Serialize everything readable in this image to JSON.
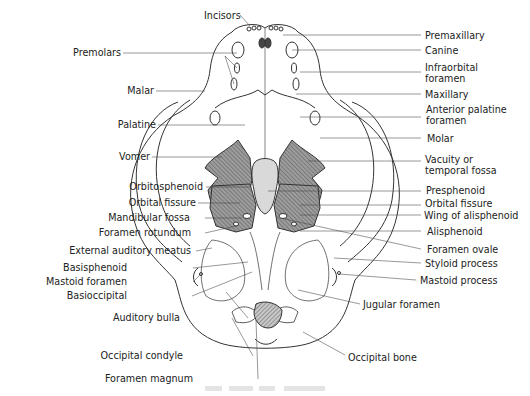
{
  "diagram": {
    "colors": {
      "line": "#333333",
      "hatch_fill": "#9a9a9a",
      "light_fill": "#d8d8d8",
      "background": "#ffffff"
    },
    "labels_left": [
      {
        "id": "premolars",
        "text": "Premolars",
        "x": 130,
        "y": 48
      },
      {
        "id": "malar",
        "text": "Malar",
        "x": 133,
        "y": 86
      },
      {
        "id": "palatine",
        "text": "Palatine",
        "x": 131,
        "y": 120
      },
      {
        "id": "vomer",
        "text": "Vomer",
        "x": 130,
        "y": 152
      },
      {
        "id": "orbitosphenoid",
        "text": "Orbitosphenoid",
        "x": 131,
        "y": 182
      },
      {
        "id": "orbital-fissure-left",
        "text": "Orbital fissure",
        "x": 130,
        "y": 198
      },
      {
        "id": "mandibular-fossa",
        "text": "Mandibular fossa",
        "x": 130,
        "y": 213
      },
      {
        "id": "foramen-rotundum",
        "text": "Foramen rotundum",
        "x": 130,
        "y": 228
      },
      {
        "id": "external-auditory-meatus",
        "text": "External auditory meatus",
        "x": 128,
        "y": 246
      },
      {
        "id": "basisphenoid",
        "text": "Basisphenoid",
        "x": 127,
        "y": 263
      },
      {
        "id": "mastoid-foramen",
        "text": "Mastoid foramen",
        "x": 127,
        "y": 277
      },
      {
        "id": "basioccipital",
        "text": "Basioccipital",
        "x": 127,
        "y": 291
      },
      {
        "id": "auditory-bulla",
        "text": "Auditory bulla",
        "x": 180,
        "y": 313
      },
      {
        "id": "occipital-condyle",
        "text": "Occipital condyle",
        "x": 183,
        "y": 351
      },
      {
        "id": "foramen-magnum",
        "text": "Foramen magnum",
        "x": 193,
        "y": 374
      }
    ],
    "labels_right": [
      {
        "id": "premaxillary",
        "text": "Premaxillary",
        "x": 425,
        "y": 30
      },
      {
        "id": "canine",
        "text": "Canine",
        "x": 425,
        "y": 46
      },
      {
        "id": "infraorbital-foramen",
        "text": "Infraorbital\nforamen",
        "x": 425,
        "y": 64
      },
      {
        "id": "maxillary",
        "text": "Maxillary",
        "x": 425,
        "y": 90
      },
      {
        "id": "anterior-palatine-foramen",
        "text": "Anterior palatine\nforamen",
        "x": 426,
        "y": 106
      },
      {
        "id": "molar",
        "text": "Molar",
        "x": 427,
        "y": 134
      },
      {
        "id": "vacuity-temporal-fossa",
        "text": "Vacuity or\ntemporal fossa",
        "x": 425,
        "y": 156
      },
      {
        "id": "presphenoid",
        "text": "Presphenoid",
        "x": 426,
        "y": 186
      },
      {
        "id": "orbital-fissure-right",
        "text": "Orbital fissure",
        "x": 425,
        "y": 200
      },
      {
        "id": "wing-of-alisphenoid",
        "text": "Wing of alisphenoid",
        "x": 424,
        "y": 211
      },
      {
        "id": "alisphenoid",
        "text": "Alisphenoid",
        "x": 427,
        "y": 227
      },
      {
        "id": "foramen-ovale",
        "text": "Foramen ovale",
        "x": 427,
        "y": 245
      },
      {
        "id": "styloid-process",
        "text": "Styloid process",
        "x": 425,
        "y": 259
      },
      {
        "id": "mastoid-process",
        "text": "Mastoid process",
        "x": 420,
        "y": 276
      },
      {
        "id": "jugular-foramen",
        "text": "Jugular foramen",
        "x": 363,
        "y": 300
      },
      {
        "id": "occipital-bone",
        "text": "Occipital bone",
        "x": 348,
        "y": 353
      }
    ],
    "labels_top": [
      {
        "id": "incisors",
        "text": "Incisors",
        "x": 204,
        "y": 12
      }
    ]
  }
}
